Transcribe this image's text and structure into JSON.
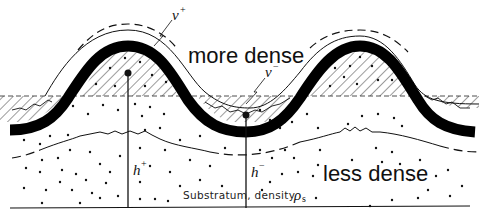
{
  "figure": {
    "labels": {
      "upper_layer": "more dense",
      "lower_layer": "less dense",
      "substratum": "Substratum, density",
      "substratum_symbol": "ρ",
      "substratum_symbol_sub": "s",
      "v_plus": "v",
      "v_plus_sup": "+",
      "v_minus": "v",
      "v_minus_sup": "−",
      "h_plus": "h",
      "h_plus_sup": "+",
      "h_minus": "h",
      "h_minus_sup": "−"
    },
    "colors": {
      "ink": "#111111",
      "background": "#ffffff"
    }
  }
}
